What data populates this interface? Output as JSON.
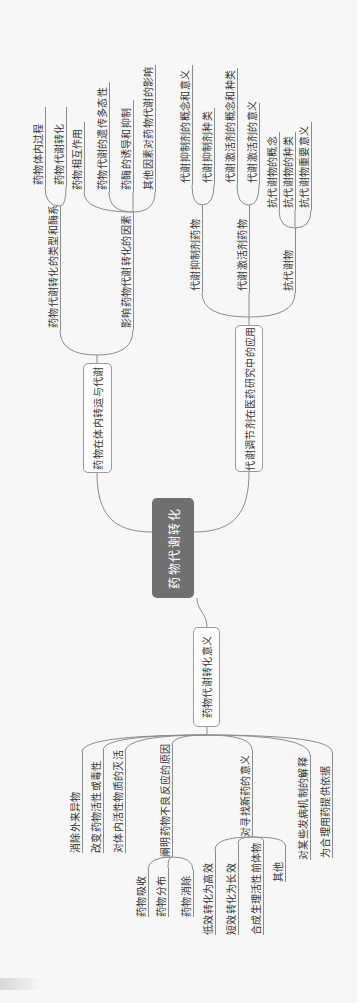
{
  "theme": {
    "background": "#f7f7f7",
    "line_color": "#8c8c8c",
    "text_color": "#333333",
    "root_fill": "#707070",
    "root_text": "#ffffff"
  },
  "central": {
    "label": "药物代谢转化"
  },
  "branches": {
    "transport": {
      "label": "药物在体内转运与代谢",
      "children": [
        {
          "label": "药物代谢转化的类型和酶系",
          "children": [
            {
              "label": "药物体内过程"
            },
            {
              "label": "药物代谢转化"
            }
          ]
        },
        {
          "label": "影响药物代谢转化的因素",
          "children": [
            {
              "label": "药物相互作用"
            },
            {
              "label": "药物代谢的遗传多态性"
            },
            {
              "label": "药酶的诱导和抑制"
            },
            {
              "label": "其他因素对药物代谢的影响"
            }
          ]
        }
      ]
    },
    "regulators": {
      "label": "代谢调节剂在医药研究中的应用",
      "children": [
        {
          "label": "代谢抑制剂药物",
          "children": [
            {
              "label": "代谢抑制剂的概念和意义"
            },
            {
              "label": "代谢抑制剂种类"
            }
          ]
        },
        {
          "label": "代谢激活剂药物",
          "children": [
            {
              "label": "代谢激活剂的概念和种类"
            },
            {
              "label": "代谢激活剂的意义"
            }
          ]
        },
        {
          "label": "抗代谢物",
          "children": [
            {
              "label": "抗代谢物的概念"
            },
            {
              "label": "抗代谢物的种类"
            },
            {
              "label": "抗代谢物重要意义"
            }
          ]
        }
      ]
    },
    "significance": {
      "label": "药物代谢转化意义",
      "children": [
        {
          "label": "消除外来异物"
        },
        {
          "label": "改变药物活性或毒性"
        },
        {
          "label": "对体内活性物质的灭活"
        },
        {
          "label": "阐明药物不良反应的原因",
          "children": [
            {
              "label": "药物吸收"
            },
            {
              "label": "药物分布"
            },
            {
              "label": "药物消除"
            }
          ]
        },
        {
          "label": "对寻找新药的意义",
          "children": [
            {
              "label": "低效转化为高效"
            },
            {
              "label": "短效转化为长效"
            },
            {
              "label": "合成生理活性前体物"
            },
            {
              "label": "其他"
            }
          ]
        },
        {
          "label": "对某些发病机制的解释"
        },
        {
          "label": "为合理用药提供依据"
        }
      ]
    }
  }
}
